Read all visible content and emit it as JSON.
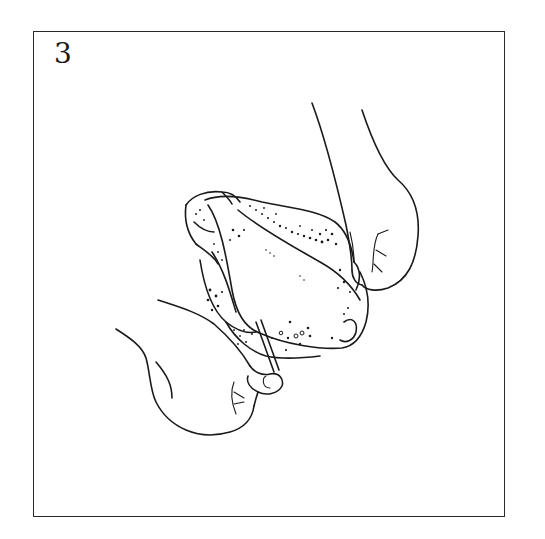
{
  "figure": {
    "step_number": "3",
    "colors": {
      "ink": "#1a1a1a",
      "frame": "#2a2a2a",
      "background": "#ffffff"
    }
  }
}
